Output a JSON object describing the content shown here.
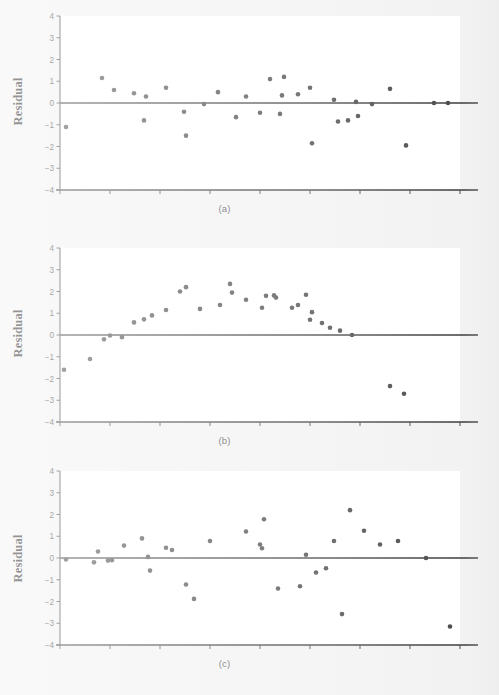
{
  "figure": {
    "background_color": "#f2f2f2",
    "plot_background_color": "#ffffff",
    "axis_color": "#4a4a4a",
    "zero_line_color": "#3c3c3c",
    "marker_color": "#4a4a4a",
    "y_axis_label": "Residual",
    "panel_captions": [
      "(a)",
      "(b)",
      "(c)"
    ]
  },
  "chart_data": [
    {
      "type": "scatter",
      "title": "(a)",
      "xlabel": "",
      "ylabel": "Residual",
      "ylim": [
        -4,
        4
      ],
      "xlim": [
        0,
        100
      ],
      "yticks": [
        4,
        3,
        2,
        1,
        0,
        -1,
        -2,
        -3,
        -4
      ],
      "ytick_labels": [
        "4",
        "3",
        "2",
        "1",
        "0",
        "-1",
        "-2",
        "-3",
        "-4"
      ],
      "xticks": [
        0,
        12.5,
        25,
        37.5,
        50,
        62.5,
        75,
        87.5,
        100
      ],
      "xtick_labels": [
        "",
        "",
        "",
        "",
        "",
        "",
        "",
        "",
        ""
      ],
      "grid": false,
      "legend": null,
      "reference_line_y": 0,
      "x": [
        1.5,
        10.5,
        13.5,
        18.5,
        21.5,
        21.0,
        26.5,
        31.0,
        31.5,
        36.0,
        39.5,
        44.0,
        46.5,
        50.0,
        52.5,
        55.5,
        55.0,
        56.0,
        59.5,
        63.0,
        62.5,
        68.5,
        69.5,
        72.0,
        74.5,
        74.0,
        78.0,
        82.5,
        86.5,
        93.5,
        97.0
      ],
      "y": [
        -1.1,
        1.15,
        0.6,
        0.45,
        0.3,
        -0.8,
        0.7,
        -0.4,
        -1.5,
        -0.05,
        0.5,
        -0.65,
        0.3,
        -0.45,
        1.1,
        0.35,
        -0.5,
        1.2,
        0.4,
        -1.85,
        0.7,
        0.15,
        -0.85,
        -0.8,
        -0.6,
        0.05,
        -0.05,
        0.65,
        -1.95,
        0.0,
        0.0
      ]
    },
    {
      "type": "scatter",
      "title": "(b)",
      "xlabel": "",
      "ylabel": "Residual",
      "ylim": [
        -4,
        4
      ],
      "xlim": [
        0,
        100
      ],
      "yticks": [
        4,
        3,
        2,
        1,
        0,
        -1,
        -2,
        -3,
        -4
      ],
      "ytick_labels": [
        "4",
        "3",
        "2",
        "1",
        "0",
        "-1",
        "-2",
        "-3",
        "-4"
      ],
      "xticks": [
        0,
        12.5,
        25,
        37.5,
        50,
        62.5,
        75,
        87.5,
        100
      ],
      "xtick_labels": [
        "",
        "",
        "",
        "",
        "",
        "",
        "",
        "",
        ""
      ],
      "grid": false,
      "legend": null,
      "reference_line_y": 0,
      "x": [
        1.0,
        7.5,
        11.0,
        12.5,
        15.5,
        18.5,
        21.0,
        23.0,
        26.5,
        30.0,
        31.5,
        35.0,
        40.0,
        42.5,
        43.0,
        46.5,
        50.5,
        51.5,
        53.5,
        54.0,
        58.0,
        59.5,
        61.5,
        62.5,
        63.0,
        65.5,
        67.5,
        70.0,
        73.0,
        82.5,
        86.0
      ],
      "y": [
        -1.6,
        -1.1,
        -0.2,
        -0.02,
        -0.1,
        0.58,
        0.72,
        0.9,
        1.15,
        2.0,
        2.2,
        1.2,
        1.38,
        2.35,
        1.95,
        1.62,
        1.25,
        1.8,
        1.82,
        1.72,
        1.25,
        1.38,
        1.85,
        0.7,
        1.05,
        0.55,
        0.33,
        0.2,
        0.0,
        -2.35,
        -2.7
      ]
    },
    {
      "type": "scatter",
      "title": "(c)",
      "xlabel": "",
      "ylabel": "Residual",
      "ylim": [
        -4,
        4
      ],
      "xlim": [
        0,
        100
      ],
      "yticks": [
        4,
        3,
        2,
        1,
        0,
        -1,
        -2,
        -3,
        -4
      ],
      "ytick_labels": [
        "4",
        "3",
        "2",
        "1",
        "0",
        "-1",
        "-2",
        "-3",
        "-4"
      ],
      "xticks": [
        0,
        12.5,
        25,
        37.5,
        50,
        62.5,
        75,
        87.5,
        100
      ],
      "xtick_labels": [
        "",
        "",
        "",
        "",
        "",
        "",
        "",
        "",
        ""
      ],
      "grid": false,
      "legend": null,
      "reference_line_y": 0,
      "x": [
        1.5,
        8.5,
        9.5,
        12.0,
        13.0,
        16.0,
        20.5,
        22.0,
        22.5,
        26.5,
        28.0,
        31.5,
        33.5,
        37.5,
        46.5,
        50.0,
        50.5,
        51.0,
        54.5,
        60.0,
        61.5,
        64.0,
        66.5,
        68.5,
        70.5,
        72.5,
        76.0,
        80.0,
        84.5,
        91.5,
        97.5
      ],
      "y": [
        -0.07,
        -0.2,
        0.3,
        -0.12,
        -0.1,
        0.57,
        0.9,
        0.05,
        -0.58,
        0.47,
        0.37,
        -1.22,
        -1.88,
        0.78,
        1.22,
        0.62,
        0.45,
        1.78,
        -1.4,
        -1.3,
        0.15,
        -0.67,
        -0.47,
        0.78,
        -2.58,
        2.2,
        1.25,
        0.62,
        0.78,
        0.0,
        -3.15
      ]
    }
  ]
}
